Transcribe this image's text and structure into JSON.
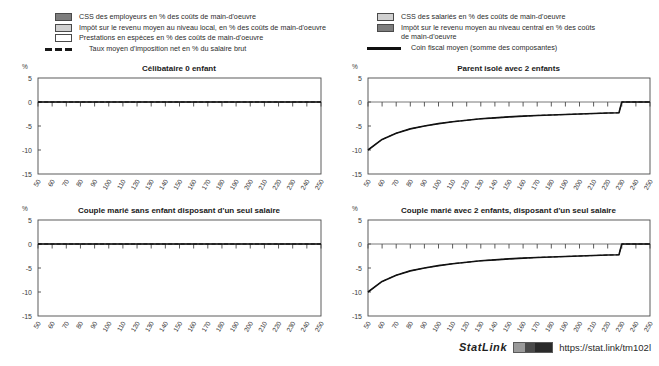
{
  "legend": {
    "left_items": [
      {
        "swatch": "dark-gray-swatch",
        "label": "CSS des employeurs en % des coûts de main-d'oeuvre"
      },
      {
        "swatch": "light-gray-swatch",
        "label": "Impôt sur le revenu moyen au niveau local, en % des coûts de main-d'oeuvre"
      },
      {
        "swatch": "white-swatch",
        "label": "Prestations en espèces en % des coûts de main-d'oeuvre"
      },
      {
        "swatch": "dashed-line-key",
        "label": "Taux moyen d'imposition net en % du salaire brut"
      }
    ],
    "right_items": [
      {
        "swatch": "light-gray-swatch",
        "label": "CSS des salariés en % des coûts de main-d'oeuvre"
      },
      {
        "swatch": "dark-gray-swatch",
        "label": "Impôt sur le revenu moyen au niveau central en %  des coûts\nde main-d'oeuvre"
      },
      {
        "swatch": "solid-line-key",
        "label": "Coin fiscal moyen (somme des composantes)"
      }
    ]
  },
  "axis_unit": "%",
  "footer": {
    "statlink_word": "StatLink",
    "statlink_url": "https://stat.link/tm102l"
  },
  "chart_data": [
    {
      "id": "celibataire-0-enfant",
      "type": "line",
      "title": "Célibataire 0 enfant",
      "xlabel": "",
      "ylabel": "%",
      "ylim": [
        -15,
        5
      ],
      "yticks": [
        5,
        0,
        -5,
        -10,
        -15
      ],
      "xlim": [
        50,
        250
      ],
      "xticks": [
        50,
        60,
        70,
        80,
        90,
        100,
        110,
        120,
        130,
        140,
        150,
        160,
        170,
        180,
        190,
        200,
        210,
        220,
        230,
        240,
        250
      ],
      "grid": false,
      "legend_position": "top",
      "series": [
        {
          "name": "Coin fiscal moyen (somme des composantes)",
          "style": "solid",
          "x": [
            50,
            60,
            70,
            80,
            90,
            100,
            110,
            120,
            130,
            140,
            150,
            160,
            170,
            180,
            190,
            200,
            210,
            220,
            230,
            240,
            250
          ],
          "values": [
            0,
            0,
            0,
            0,
            0,
            0,
            0,
            0,
            0,
            0,
            0,
            0,
            0,
            0,
            0,
            0,
            0,
            0,
            0,
            0,
            0
          ]
        },
        {
          "name": "Taux moyen d'imposition net en % du salaire brut",
          "style": "dashed",
          "x": [
            50,
            60,
            70,
            80,
            90,
            100,
            110,
            120,
            130,
            140,
            150,
            160,
            170,
            180,
            190,
            200,
            210,
            220,
            230,
            240,
            250
          ],
          "values": [
            0,
            0,
            0,
            0,
            0,
            0,
            0,
            0,
            0,
            0,
            0,
            0,
            0,
            0,
            0,
            0,
            0,
            0,
            0,
            0,
            0
          ]
        }
      ]
    },
    {
      "id": "parent-isole-2-enfants",
      "type": "line",
      "title": "Parent isolé avec 2 enfants",
      "xlabel": "",
      "ylabel": "%",
      "ylim": [
        -15,
        5
      ],
      "yticks": [
        5,
        0,
        -5,
        -10,
        -15
      ],
      "xlim": [
        50,
        250
      ],
      "xticks": [
        50,
        60,
        70,
        80,
        90,
        100,
        110,
        120,
        130,
        140,
        150,
        160,
        170,
        180,
        190,
        200,
        210,
        220,
        230,
        240,
        250
      ],
      "grid": false,
      "legend_position": "top",
      "series": [
        {
          "name": "Coin fiscal moyen (somme des composantes)",
          "style": "solid",
          "x": [
            50,
            60,
            70,
            80,
            90,
            100,
            110,
            120,
            130,
            140,
            150,
            160,
            170,
            180,
            190,
            200,
            210,
            220,
            228,
            230,
            240,
            250
          ],
          "values": [
            -10.0,
            -7.8,
            -6.5,
            -5.6,
            -5.0,
            -4.5,
            -4.1,
            -3.8,
            -3.5,
            -3.3,
            -3.1,
            -2.95,
            -2.8,
            -2.7,
            -2.6,
            -2.5,
            -2.4,
            -2.3,
            -2.25,
            0,
            0,
            0
          ]
        },
        {
          "name": "Taux moyen d'imposition net en % du salaire brut",
          "style": "dashed",
          "x": [
            50,
            60,
            70,
            80,
            90,
            100,
            110,
            120,
            130,
            140,
            150,
            160,
            170,
            180,
            190,
            200,
            210,
            220,
            228,
            230,
            240,
            250
          ],
          "values": [
            -10.0,
            -7.8,
            -6.5,
            -5.6,
            -5.0,
            -4.5,
            -4.1,
            -3.8,
            -3.5,
            -3.3,
            -3.1,
            -2.95,
            -2.8,
            -2.7,
            -2.6,
            -2.5,
            -2.4,
            -2.3,
            -2.25,
            0,
            0,
            0
          ]
        }
      ]
    },
    {
      "id": "couple-marie-sans-enfant",
      "type": "line",
      "title": "Couple marié sans enfant disposant d'un seul salaire",
      "xlabel": "",
      "ylabel": "%",
      "ylim": [
        -15,
        5
      ],
      "yticks": [
        5,
        0,
        -5,
        -10,
        -15
      ],
      "xlim": [
        50,
        250
      ],
      "xticks": [
        50,
        60,
        70,
        80,
        90,
        100,
        110,
        120,
        130,
        140,
        150,
        160,
        170,
        180,
        190,
        200,
        210,
        220,
        230,
        240,
        250
      ],
      "grid": false,
      "legend_position": "top",
      "series": [
        {
          "name": "Coin fiscal moyen (somme des composantes)",
          "style": "solid",
          "x": [
            50,
            60,
            70,
            80,
            90,
            100,
            110,
            120,
            130,
            140,
            150,
            160,
            170,
            180,
            190,
            200,
            210,
            220,
            230,
            240,
            250
          ],
          "values": [
            0,
            0,
            0,
            0,
            0,
            0,
            0,
            0,
            0,
            0,
            0,
            0,
            0,
            0,
            0,
            0,
            0,
            0,
            0,
            0,
            0
          ]
        },
        {
          "name": "Taux moyen d'imposition net en % du salaire brut",
          "style": "dashed",
          "x": [
            50,
            60,
            70,
            80,
            90,
            100,
            110,
            120,
            130,
            140,
            150,
            160,
            170,
            180,
            190,
            200,
            210,
            220,
            230,
            240,
            250
          ],
          "values": [
            0,
            0,
            0,
            0,
            0,
            0,
            0,
            0,
            0,
            0,
            0,
            0,
            0,
            0,
            0,
            0,
            0,
            0,
            0,
            0,
            0
          ]
        }
      ]
    },
    {
      "id": "couple-marie-2-enfants",
      "type": "line",
      "title": "Couple marié avec 2 enfants, disposant d'un seul salaire",
      "xlabel": "",
      "ylabel": "%",
      "ylim": [
        -15,
        5
      ],
      "yticks": [
        5,
        0,
        -5,
        -10,
        -15
      ],
      "xlim": [
        50,
        250
      ],
      "xticks": [
        50,
        60,
        70,
        80,
        90,
        100,
        110,
        120,
        130,
        140,
        150,
        160,
        170,
        180,
        190,
        200,
        210,
        220,
        230,
        240,
        250
      ],
      "grid": false,
      "legend_position": "top",
      "series": [
        {
          "name": "Coin fiscal moyen (somme des composantes)",
          "style": "solid",
          "x": [
            50,
            60,
            70,
            80,
            90,
            100,
            110,
            120,
            130,
            140,
            150,
            160,
            170,
            180,
            190,
            200,
            210,
            220,
            228,
            230,
            240,
            250
          ],
          "values": [
            -10.0,
            -7.8,
            -6.5,
            -5.6,
            -5.0,
            -4.5,
            -4.1,
            -3.8,
            -3.5,
            -3.3,
            -3.1,
            -2.95,
            -2.8,
            -2.7,
            -2.6,
            -2.5,
            -2.4,
            -2.3,
            -2.25,
            0,
            0,
            0
          ]
        },
        {
          "name": "Taux moyen d'imposition net en % du salaire brut",
          "style": "dashed",
          "x": [
            50,
            60,
            70,
            80,
            90,
            100,
            110,
            120,
            130,
            140,
            150,
            160,
            170,
            180,
            190,
            200,
            210,
            220,
            228,
            230,
            240,
            250
          ],
          "values": [
            -10.0,
            -7.8,
            -6.5,
            -5.6,
            -5.0,
            -4.5,
            -4.1,
            -3.8,
            -3.5,
            -3.3,
            -3.1,
            -2.95,
            -2.8,
            -2.7,
            -2.6,
            -2.5,
            -2.4,
            -2.3,
            -2.25,
            0,
            0,
            0
          ]
        }
      ]
    }
  ]
}
